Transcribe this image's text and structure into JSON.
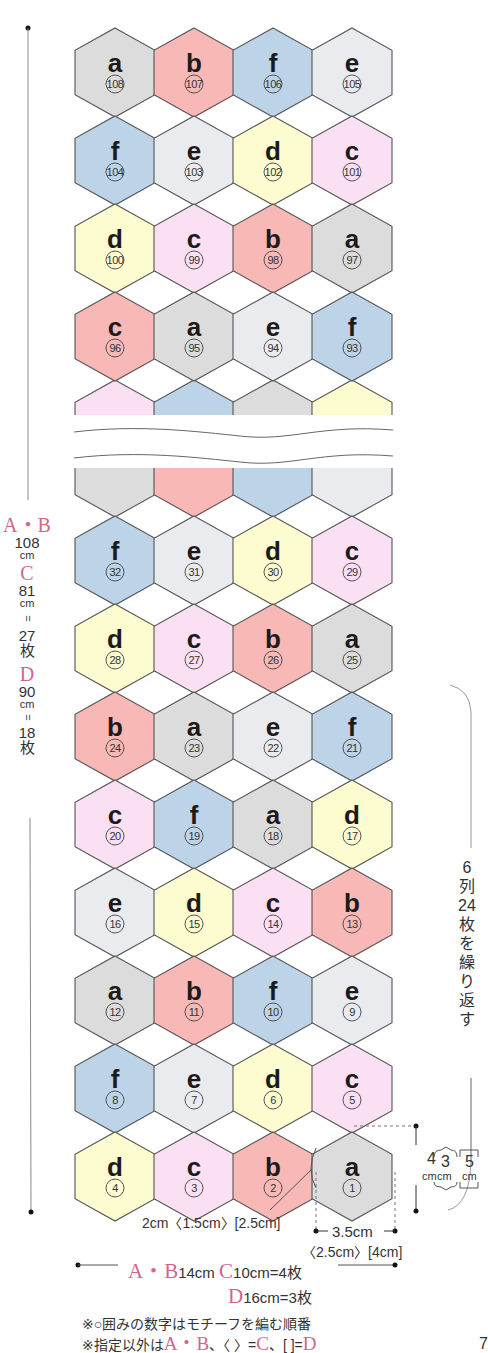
{
  "colors": {
    "a": "#dcdcdc",
    "b": "#f7b8b6",
    "c": "#fbe0f3",
    "d": "#fdfbd0",
    "e": "#e9ebee",
    "f": "#bdd3e7",
    "outline": "#555555",
    "accent_pink": "#d0668e"
  },
  "hex_geometry": {
    "width": 80,
    "height": 89,
    "col_centers_x": [
      115,
      194,
      273,
      352
    ],
    "row_pitch": 88
  },
  "upper_section": {
    "rows": [
      {
        "top_y": 28,
        "cells": [
          {
            "yarn": "a",
            "order": "108"
          },
          {
            "yarn": "b",
            "order": "107"
          },
          {
            "yarn": "f",
            "order": "106"
          },
          {
            "yarn": "e",
            "order": "105"
          }
        ]
      },
      {
        "top_y": 116,
        "cells": [
          {
            "yarn": "f",
            "order": "104"
          },
          {
            "yarn": "e",
            "order": "103"
          },
          {
            "yarn": "d",
            "order": "102"
          },
          {
            "yarn": "c",
            "order": "101"
          }
        ]
      },
      {
        "top_y": 204,
        "cells": [
          {
            "yarn": "d",
            "order": "100"
          },
          {
            "yarn": "c",
            "order": "99"
          },
          {
            "yarn": "b",
            "order": "98"
          },
          {
            "yarn": "a",
            "order": "97"
          }
        ]
      },
      {
        "top_y": 292,
        "cells": [
          {
            "yarn": "b",
            "label": "c",
            "order": "96"
          },
          {
            "yarn": "a",
            "order": "95"
          },
          {
            "yarn": "e",
            "order": "94"
          },
          {
            "yarn": "f",
            "order": "93"
          }
        ]
      }
    ],
    "partial_row": {
      "top_y": 380,
      "clip_y": 415,
      "colors": [
        "c",
        "f",
        "a",
        "d"
      ]
    }
  },
  "break_marks": {
    "y1": 430,
    "y2": 456
  },
  "lower_section": {
    "partial_row": {
      "top_y": 428,
      "clip_y": 468,
      "colors": [
        "a",
        "b",
        "f",
        "e"
      ]
    },
    "rows": [
      {
        "top_y": 516,
        "cells": [
          {
            "yarn": "f",
            "order": "32"
          },
          {
            "yarn": "e",
            "order": "31"
          },
          {
            "yarn": "d",
            "order": "30"
          },
          {
            "yarn": "c",
            "order": "29"
          }
        ]
      },
      {
        "top_y": 604,
        "cells": [
          {
            "yarn": "d",
            "order": "28"
          },
          {
            "yarn": "c",
            "order": "27"
          },
          {
            "yarn": "b",
            "order": "26"
          },
          {
            "yarn": "a",
            "order": "25"
          }
        ]
      },
      {
        "top_y": 692,
        "cells": [
          {
            "yarn": "b",
            "order": "24"
          },
          {
            "yarn": "a",
            "order": "23"
          },
          {
            "yarn": "e",
            "order": "22"
          },
          {
            "yarn": "f",
            "order": "21"
          }
        ]
      },
      {
        "top_y": 780,
        "cells": [
          {
            "yarn": "c",
            "order": "20"
          },
          {
            "yarn": "f",
            "order": "19"
          },
          {
            "yarn": "a",
            "order": "18"
          },
          {
            "yarn": "d",
            "order": "17"
          }
        ]
      },
      {
        "top_y": 868,
        "cells": [
          {
            "yarn": "e",
            "order": "16"
          },
          {
            "yarn": "d",
            "order": "15"
          },
          {
            "yarn": "c",
            "order": "14"
          },
          {
            "yarn": "b",
            "order": "13"
          }
        ]
      },
      {
        "top_y": 956,
        "cells": [
          {
            "yarn": "a",
            "order": "12"
          },
          {
            "yarn": "b",
            "order": "11"
          },
          {
            "yarn": "f",
            "order": "10"
          },
          {
            "yarn": "e",
            "order": "9"
          }
        ]
      },
      {
        "top_y": 1044,
        "cells": [
          {
            "yarn": "f",
            "order": "8"
          },
          {
            "yarn": "e",
            "order": "7"
          },
          {
            "yarn": "d",
            "order": "6"
          },
          {
            "yarn": "c",
            "order": "5"
          }
        ]
      },
      {
        "top_y": 1132,
        "cells": [
          {
            "yarn": "d",
            "order": "4"
          },
          {
            "yarn": "c",
            "order": "3"
          },
          {
            "yarn": "b",
            "order": "2"
          },
          {
            "yarn": "a",
            "order": "1"
          }
        ]
      }
    ]
  },
  "left_dimension": {
    "size_ab": "A・B",
    "ab_value": "108",
    "ab_unit": "cm",
    "size_c": "C",
    "c_value": "81",
    "c_unit": "cm",
    "eq1": "=",
    "c_count": "27",
    "c_count_unit": "枚",
    "size_d": "D",
    "d_value": "90",
    "d_unit": "cm",
    "eq2": "=",
    "d_count": "18",
    "d_count_unit": "枚"
  },
  "right_note": {
    "text": "6列24枚を繰り返す",
    "lines": [
      "6",
      "列",
      "24",
      "枚",
      "を",
      "繰",
      "り",
      "返",
      "す"
    ]
  },
  "motif_height": {
    "ab": "4",
    "c": "3",
    "d": "5",
    "unit": "cm"
  },
  "gap_label": "2cm〈1.5cm〉[2.5cm]",
  "motif_width": {
    "ab": "3.5cm",
    "cd": "〈2.5cm〉[4cm]"
  },
  "bottom_dimension": {
    "ab_label": "A・B",
    "ab_value": "14cm",
    "c_label": "C",
    "c_value": "10cm=4枚",
    "d_label": "D",
    "d_value": "16cm=3枚"
  },
  "notes": {
    "line1": "※○囲みの数字はモチーフを編む順番",
    "line2_prefix": "※指定以外は",
    "line2_ab": "A・B",
    "line2_mid1": "、〈 〉=",
    "line2_c": "C",
    "line2_mid2": "、[ ]=",
    "line2_d": "D"
  },
  "page_number": "7"
}
